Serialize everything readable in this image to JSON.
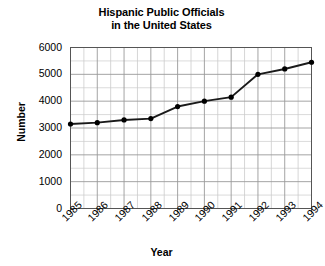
{
  "chart_data": {
    "type": "line",
    "title": "Hispanic Public Officials in the United States",
    "title_line1": "Hispanic Public Officials",
    "title_line2": "in the United States",
    "xlabel": "Year",
    "ylabel": "Number",
    "categories": [
      "1985",
      "1986",
      "1987",
      "1988",
      "1989",
      "1990",
      "1991",
      "1992",
      "1993",
      "1994"
    ],
    "values": [
      3150,
      3200,
      3300,
      3350,
      3800,
      4000,
      4150,
      5000,
      5200,
      5450
    ],
    "series": [
      {
        "name": "Hispanic Public Officials",
        "values": [
          3150,
          3200,
          3300,
          3350,
          3800,
          4000,
          4150,
          5000,
          5200,
          5450
        ]
      }
    ],
    "ylim": [
      0,
      6000
    ],
    "ytick_labels": [
      "6000",
      "5000",
      "4000",
      "3000",
      "2000",
      "1000",
      "0"
    ],
    "ytick_values": [
      6000,
      5000,
      4000,
      3000,
      2000,
      1000,
      0
    ],
    "xtick_labels": [
      "1985",
      "1986",
      "1987",
      "1988",
      "1989",
      "1990",
      "1991",
      "1992",
      "1993",
      "1994"
    ],
    "grid": true,
    "minor_grid": true,
    "legend": "none",
    "line_color": "#1a1a1a",
    "marker": "circle",
    "marker_color": "#000000",
    "grid_color": "#9a9a9a",
    "minor_grid_color": "#cccccc",
    "axis_color": "#555555",
    "background": "#ffffff"
  }
}
